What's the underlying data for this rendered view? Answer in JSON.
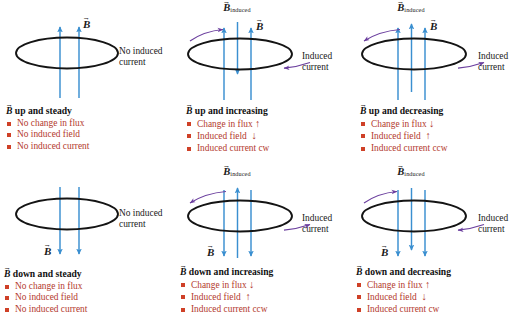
{
  "figure": {
    "colors": {
      "field_arrow": "#3a8fd0",
      "induced_arrow": "#3a8fd0",
      "loop": "#141414",
      "current_arrow": "#6b3f9e",
      "bullet_square": "#cf4027",
      "bullet_text": "#b33a2e",
      "label_text": "#1a1a1a"
    },
    "labels": {
      "b_field": "B",
      "b_induced": "B",
      "b_induced_subscript": "induced",
      "up_arrow": "↑",
      "down_arrow": "↓"
    }
  },
  "panels": [
    {
      "id": "b-up-steady",
      "row": 0,
      "column": 0,
      "title": "up and steady",
      "title_full": "B up and steady",
      "field_direction": "up",
      "field_arrow_count": 2,
      "has_induced_field": false,
      "has_induced_current": false,
      "side_note": [
        "No induced",
        "current"
      ],
      "bullets": [
        {
          "text": "No change in flux",
          "dir": ""
        },
        {
          "text": "No induced field",
          "dir": ""
        },
        {
          "text": "No induced current",
          "dir": ""
        }
      ]
    },
    {
      "id": "b-up-increasing",
      "row": 0,
      "column": 1,
      "title": "up and increasing",
      "title_full": "B up and increasing",
      "field_direction": "up",
      "field_arrow_count": 2,
      "has_induced_field": true,
      "induced_field_direction": "down",
      "has_induced_current": true,
      "current_sense": "cw",
      "side_note": [
        "Induced",
        "current"
      ],
      "bullets": [
        {
          "text": "Change in flux",
          "dir": "↑"
        },
        {
          "text": "Induced field",
          "dir": "↓"
        },
        {
          "text": "Induced current cw",
          "dir": ""
        }
      ]
    },
    {
      "id": "b-up-decreasing",
      "row": 0,
      "column": 2,
      "title": "up and decreasing",
      "title_full": "B up and decreasing",
      "field_direction": "up",
      "field_arrow_count": 2,
      "has_induced_field": true,
      "induced_field_direction": "up",
      "has_induced_current": true,
      "current_sense": "ccw",
      "side_note": [
        "Induced",
        "current"
      ],
      "bullets": [
        {
          "text": "Change in flux",
          "dir": "↓"
        },
        {
          "text": "Induced field",
          "dir": "↑"
        },
        {
          "text": "Induced current ccw",
          "dir": ""
        }
      ]
    },
    {
      "id": "b-down-steady",
      "row": 1,
      "column": 0,
      "title": "down and steady",
      "title_full": "B down and steady",
      "field_direction": "down",
      "field_arrow_count": 2,
      "has_induced_field": false,
      "has_induced_current": false,
      "side_note": [
        "No induced",
        "current"
      ],
      "bullets": [
        {
          "text": "No change in flux",
          "dir": ""
        },
        {
          "text": "No induced field",
          "dir": ""
        },
        {
          "text": "No induced current",
          "dir": ""
        }
      ]
    },
    {
      "id": "b-down-increasing",
      "row": 1,
      "column": 1,
      "title": "down and increasing",
      "title_full": "B down and increasing",
      "field_direction": "down",
      "field_arrow_count": 2,
      "has_induced_field": true,
      "induced_field_direction": "up",
      "has_induced_current": true,
      "current_sense": "ccw",
      "side_note": [
        "Induced",
        "current"
      ],
      "bullets": [
        {
          "text": "Change in flux",
          "dir": "↓"
        },
        {
          "text": "Induced field",
          "dir": "↑"
        },
        {
          "text": "Induced current ccw",
          "dir": ""
        }
      ]
    },
    {
      "id": "b-down-decreasing",
      "row": 1,
      "column": 2,
      "title": "down and decreasing",
      "title_full": "B down and decreasing",
      "field_direction": "down",
      "field_arrow_count": 2,
      "has_induced_field": true,
      "induced_field_direction": "down",
      "has_induced_current": true,
      "current_sense": "cw",
      "side_note": [
        "Induced",
        "current"
      ],
      "bullets": [
        {
          "text": "Change in flux",
          "dir": "↑"
        },
        {
          "text": "Induced field",
          "dir": "↓"
        },
        {
          "text": "Induced current cw",
          "dir": ""
        }
      ]
    }
  ]
}
